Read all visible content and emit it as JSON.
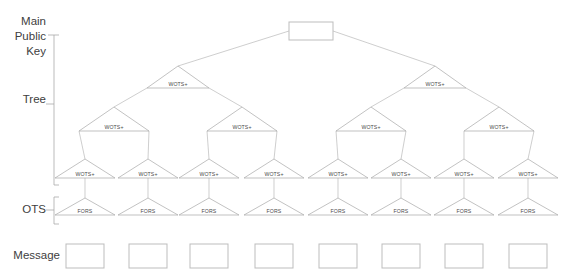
{
  "diagram": {
    "colors": {
      "edge": "#b9b9b9",
      "triangle": "#a8a8a8",
      "box": "#bdbdbd",
      "text": "#4a4a4a",
      "label": "#404040",
      "background": "#ffffff"
    },
    "side_labels": [
      {
        "id": "main-public-key",
        "text": "Main\nPublic\nKey"
      },
      {
        "id": "tree",
        "text": "Tree"
      },
      {
        "id": "ots",
        "text": "OTS"
      },
      {
        "id": "message",
        "text": "Message"
      }
    ],
    "node_labels": {
      "wots": "WOTS+",
      "fors": "FORS",
      "root": "",
      "message": ""
    },
    "levels": [
      {
        "id": "root",
        "kind": "box",
        "count": 1,
        "label": ""
      },
      {
        "id": "tree-level-1",
        "kind": "triangle",
        "count": 2,
        "label": "WOTS+"
      },
      {
        "id": "tree-level-2",
        "kind": "triangle",
        "count": 4,
        "label": "WOTS+"
      },
      {
        "id": "tree-level-3",
        "kind": "triangle",
        "count": 8,
        "label": "WOTS+"
      },
      {
        "id": "ots-level",
        "kind": "triangle",
        "count": 8,
        "label": "FORS"
      },
      {
        "id": "message-level",
        "kind": "box",
        "count": 8,
        "label": ""
      }
    ],
    "root_node": {
      "label": "",
      "x": 311,
      "y": 31
    },
    "tree_level_1": [
      {
        "label": "WOTS+",
        "x": 178,
        "y": 88
      },
      {
        "label": "WOTS+",
        "x": 435,
        "y": 88
      }
    ],
    "tree_level_2": [
      {
        "label": "WOTS+",
        "x": 114,
        "y": 131
      },
      {
        "label": "WOTS+",
        "x": 242,
        "y": 131
      },
      {
        "label": "WOTS+",
        "x": 371,
        "y": 131
      },
      {
        "label": "WOTS+",
        "x": 499,
        "y": 131
      }
    ],
    "tree_level_3": [
      {
        "label": "WOTS+",
        "x": 85,
        "y": 178
      },
      {
        "label": "WOTS+",
        "x": 148,
        "y": 178
      },
      {
        "label": "WOTS+",
        "x": 209,
        "y": 178
      },
      {
        "label": "WOTS+",
        "x": 274,
        "y": 178
      },
      {
        "label": "WOTS+",
        "x": 338,
        "y": 178
      },
      {
        "label": "WOTS+",
        "x": 401,
        "y": 178
      },
      {
        "label": "WOTS+",
        "x": 464,
        "y": 178
      },
      {
        "label": "WOTS+",
        "x": 528,
        "y": 178
      }
    ],
    "ots_level": [
      {
        "label": "FORS",
        "x": 85,
        "y": 215
      },
      {
        "label": "FORS",
        "x": 148,
        "y": 215
      },
      {
        "label": "FORS",
        "x": 209,
        "y": 215
      },
      {
        "label": "FORS",
        "x": 274,
        "y": 215
      },
      {
        "label": "FORS",
        "x": 338,
        "y": 215
      },
      {
        "label": "FORS",
        "x": 401,
        "y": 215
      },
      {
        "label": "FORS",
        "x": 464,
        "y": 215
      },
      {
        "label": "FORS",
        "x": 528,
        "y": 215
      }
    ],
    "message_level": [
      {
        "label": "",
        "x": 85,
        "y": 256
      },
      {
        "label": "",
        "x": 148,
        "y": 256
      },
      {
        "label": "",
        "x": 209,
        "y": 256
      },
      {
        "label": "",
        "x": 274,
        "y": 256
      },
      {
        "label": "",
        "x": 338,
        "y": 256
      },
      {
        "label": "",
        "x": 401,
        "y": 256
      },
      {
        "label": "",
        "x": 464,
        "y": 256
      },
      {
        "label": "",
        "x": 528,
        "y": 256
      }
    ],
    "brackets": [
      {
        "id": "tree-bracket",
        "top": 35,
        "bottom": 185,
        "x": 54
      },
      {
        "id": "ots-bracket",
        "top": 196,
        "bottom": 224,
        "x": 54
      }
    ]
  }
}
